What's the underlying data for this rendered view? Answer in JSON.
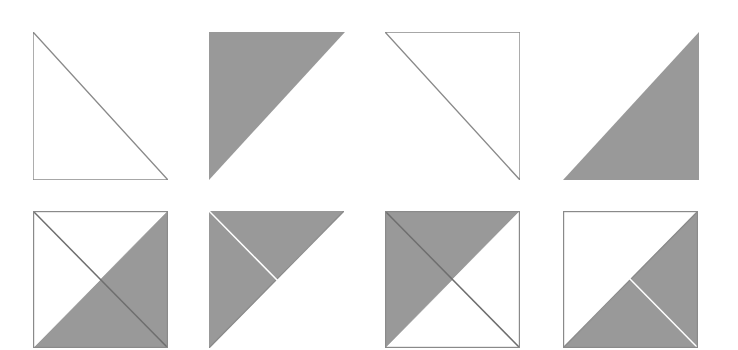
{
  "canvas": {
    "width": 738,
    "height": 350,
    "background": "#ffffff",
    "title": "Triangle Tile Grid"
  },
  "palette": {
    "fill_gray": "#999999",
    "stroke_gray": "#8a8a8a",
    "stroke_dark": "#6e6e6e",
    "white": "#ffffff"
  },
  "grid": {
    "rows": 2,
    "columns": 4,
    "tile_width": 146,
    "tile_height": 148,
    "row_tops": [
      32,
      211
    ],
    "column_lefts": [
      33,
      209,
      385,
      563
    ]
  },
  "tiles": [
    {
      "id": "tile-1",
      "name": "outline-triangle-lower-left",
      "row": 1,
      "column": 1,
      "x": 33,
      "y": 32,
      "width": 135,
      "height": 148,
      "style": "outline",
      "kind": "single-triangle",
      "corners": [
        "top-left",
        "bottom-left",
        "bottom-right"
      ],
      "fill": "#ffffff",
      "stroke": "#8a8a8a",
      "stroke_width": 1.4,
      "hypotenuse": "top-left-to-bottom-right",
      "label": "Outlined right triangle, right angle at bottom-left"
    },
    {
      "id": "tile-2",
      "name": "filled-triangle-upper-left",
      "row": 1,
      "column": 2,
      "x": 209,
      "y": 32,
      "width": 136,
      "height": 148,
      "style": "filled",
      "kind": "single-triangle",
      "corners": [
        "top-left",
        "top-right",
        "bottom-left"
      ],
      "fill": "#999999",
      "stroke": "none",
      "stroke_width": 0,
      "hypotenuse": "top-right-to-bottom-left",
      "label": "Solid gray right triangle, right angle at top-left"
    },
    {
      "id": "tile-3",
      "name": "outline-triangle-upper-right",
      "row": 1,
      "column": 3,
      "x": 385,
      "y": 32,
      "width": 135,
      "height": 148,
      "style": "outline",
      "kind": "single-triangle",
      "corners": [
        "top-left",
        "top-right",
        "bottom-right"
      ],
      "fill": "#ffffff",
      "stroke": "#8a8a8a",
      "stroke_width": 1.4,
      "hypotenuse": "top-left-to-bottom-right",
      "label": "Outlined right triangle, right angle at top-right"
    },
    {
      "id": "tile-4",
      "name": "filled-triangle-lower-right",
      "row": 1,
      "column": 4,
      "x": 563,
      "y": 32,
      "width": 136,
      "height": 148,
      "style": "filled",
      "kind": "single-triangle",
      "corners": [
        "top-right",
        "bottom-right",
        "bottom-left"
      ],
      "fill": "#999999",
      "stroke": "none",
      "stroke_width": 0,
      "hypotenuse": "top-right-to-bottom-left",
      "label": "Solid gray right triangle, right angle at bottom-right"
    },
    {
      "id": "tile-5",
      "name": "quad-square-right-bottom-gray-dark-diagonal",
      "row": 2,
      "column": 1,
      "x": 33,
      "y": 211,
      "width": 135,
      "height": 137,
      "style": "quartered",
      "kind": "four-quadrant-square",
      "quadrants": {
        "top": "#ffffff",
        "right": "#999999",
        "bottom": "#999999",
        "left": "#ffffff"
      },
      "outline": "#8a8a8a",
      "main_diagonal": "top-left-to-bottom-right",
      "main_diagonal_color": "#6e6e6e",
      "main_diagonal_visible": true,
      "anti_diagonal_color": "none",
      "anti_diagonal_visible": false,
      "label": "Square split by both diagonals; right and bottom quadrants gray"
    },
    {
      "id": "tile-6",
      "name": "quad-square-top-left-gray-light-diagonal",
      "row": 2,
      "column": 2,
      "x": 209,
      "y": 211,
      "width": 135,
      "height": 137,
      "style": "quartered",
      "kind": "four-quadrant-square",
      "quadrants": {
        "top": "#999999",
        "right": "#ffffff",
        "bottom": "#ffffff",
        "left": "#999999"
      },
      "outline": "none",
      "main_diagonal": "top-left-to-bottom-right",
      "main_diagonal_color": "#ffffff",
      "main_diagonal_visible": true,
      "anti_diagonal_color": "#8a8a8a",
      "anti_diagonal_visible": true,
      "label": "Square split by both diagonals; top and left quadrants gray, white split line"
    },
    {
      "id": "tile-7",
      "name": "quad-square-top-left-gray-dark-diagonal",
      "row": 2,
      "column": 3,
      "x": 385,
      "y": 211,
      "width": 135,
      "height": 137,
      "style": "quartered",
      "kind": "four-quadrant-square",
      "quadrants": {
        "top": "#999999",
        "right": "#ffffff",
        "bottom": "#ffffff",
        "left": "#999999"
      },
      "outline": "#8a8a8a",
      "main_diagonal": "top-left-to-bottom-right",
      "main_diagonal_color": "#6e6e6e",
      "main_diagonal_visible": true,
      "anti_diagonal_color": "none",
      "anti_diagonal_visible": false,
      "label": "Square split by both diagonals; top and left quadrants gray, dark split line"
    },
    {
      "id": "tile-8",
      "name": "quad-square-right-bottom-gray-light-diagonal",
      "row": 2,
      "column": 4,
      "x": 563,
      "y": 211,
      "width": 135,
      "height": 137,
      "style": "quartered",
      "kind": "four-quadrant-square",
      "quadrants": {
        "top": "#ffffff",
        "right": "#999999",
        "bottom": "#999999",
        "left": "#ffffff"
      },
      "outline": "#8a8a8a",
      "main_diagonal": "top-left-to-bottom-right",
      "main_diagonal_color": "#ffffff",
      "main_diagonal_visible": true,
      "anti_diagonal_color": "#8a8a8a",
      "anti_diagonal_visible": true,
      "label": "Square split by both diagonals; right and bottom quadrants gray, white split line"
    }
  ]
}
